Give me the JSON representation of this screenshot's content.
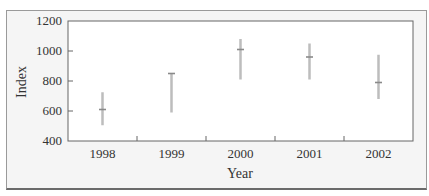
{
  "chart_data": {
    "type": "range",
    "title": "",
    "xlabel": "Year",
    "ylabel": "Index",
    "ylim": [
      400,
      1200
    ],
    "yticks": [
      400,
      600,
      800,
      1000,
      1200
    ],
    "categories": [
      "1998",
      "1999",
      "2000",
      "2001",
      "2002"
    ],
    "series": [
      {
        "name": "high",
        "values": [
          725,
          850,
          1080,
          1050,
          975
        ]
      },
      {
        "name": "value",
        "values": [
          610,
          850,
          1010,
          960,
          790
        ]
      },
      {
        "name": "low",
        "values": [
          505,
          590,
          810,
          810,
          680
        ]
      }
    ],
    "grid": false,
    "legend": null,
    "colors": {
      "bar": "#bdbdbd",
      "marker": "#8a8a8a",
      "axis": "#666666",
      "frame_bg": "#f5f5f5",
      "plot_bg": "#ffffff"
    }
  }
}
